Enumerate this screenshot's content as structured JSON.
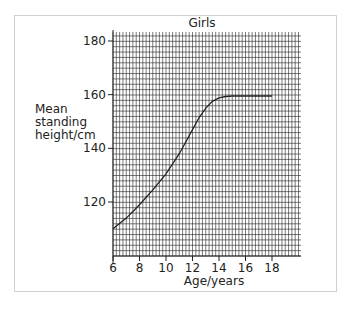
{
  "chart_data": {
    "type": "line",
    "title": "Girls",
    "xlabel": "Age/years",
    "ylabel": "Mean standing height/cm",
    "ylabel_lines": [
      "Mean",
      "standing",
      "height/cm"
    ],
    "xlim": [
      6,
      20
    ],
    "ylim": [
      107,
      183
    ],
    "xticks": [
      6,
      8,
      10,
      12,
      14,
      16,
      18
    ],
    "yticks": [
      120,
      140,
      160,
      180
    ],
    "grid": true,
    "series": [
      {
        "name": "Girls",
        "x": [
          6,
          7,
          8,
          9,
          10,
          11,
          12,
          12.5,
          13,
          13.5,
          14,
          14.5,
          15,
          16,
          17,
          18
        ],
        "y": [
          110,
          114,
          119,
          124.5,
          130.5,
          138,
          147,
          151.5,
          155,
          157.5,
          158.8,
          159.3,
          159.5,
          159.5,
          159.5,
          159.5
        ]
      }
    ]
  }
}
